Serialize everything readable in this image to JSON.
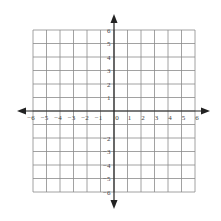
{
  "diagram": {
    "type": "coordinate-plane",
    "x_range": [
      -6,
      6
    ],
    "y_range": [
      -6,
      6
    ],
    "x_tick_labels": [
      "-6",
      "-5",
      "-4",
      "-3",
      "-2",
      "-1",
      "0",
      "1",
      "2",
      "3",
      "4",
      "5",
      "6"
    ],
    "y_tick_labels_positive": [
      "1",
      "2",
      "3",
      "4",
      "5",
      "6"
    ],
    "y_tick_labels_negative": [
      "-2",
      "-3",
      "-4",
      "-5",
      "-6"
    ],
    "origin_label": "0",
    "axes_arrows": true,
    "colors": {
      "grid": "#8a8a8a",
      "axis": "#222222",
      "labels": "#444444",
      "background": "#ffffff"
    }
  }
}
